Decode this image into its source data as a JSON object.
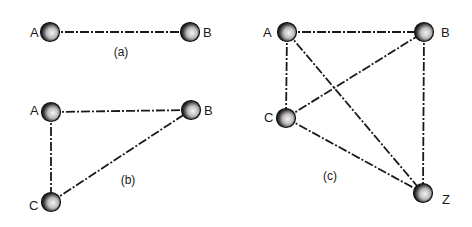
{
  "figures": [
    {
      "caption": "(a)",
      "caption_pos": [
        121,
        56
      ],
      "nodes": [
        {
          "id": "A",
          "label": "A",
          "x": 50,
          "y": 32,
          "lx": 30,
          "ly": 37
        },
        {
          "id": "B",
          "label": "B",
          "x": 190,
          "y": 32,
          "lx": 203,
          "ly": 37
        }
      ],
      "edges": [
        [
          "A",
          "B"
        ]
      ]
    },
    {
      "caption": "(b)",
      "caption_pos": [
        128,
        184
      ],
      "nodes": [
        {
          "id": "A",
          "label": "A",
          "x": 51,
          "y": 112,
          "lx": 30,
          "ly": 115
        },
        {
          "id": "B",
          "label": "B",
          "x": 191,
          "y": 110,
          "lx": 204,
          "ly": 115
        },
        {
          "id": "C",
          "label": "C",
          "x": 51,
          "y": 202,
          "lx": 29,
          "ly": 210
        }
      ],
      "edges": [
        [
          "A",
          "B"
        ],
        [
          "A",
          "C"
        ],
        [
          "C",
          "B"
        ]
      ]
    },
    {
      "caption": "(c)",
      "caption_pos": [
        330,
        180
      ],
      "nodes": [
        {
          "id": "A",
          "label": "A",
          "x": 287,
          "y": 32,
          "lx": 263,
          "ly": 37
        },
        {
          "id": "B",
          "label": "B",
          "x": 424,
          "y": 32,
          "lx": 441,
          "ly": 37
        },
        {
          "id": "C",
          "label": "C",
          "x": 286,
          "y": 118,
          "lx": 264,
          "ly": 122
        },
        {
          "id": "Z",
          "label": "Z",
          "x": 423,
          "y": 193,
          "lx": 442,
          "ly": 204
        }
      ],
      "edges": [
        [
          "A",
          "B"
        ],
        [
          "A",
          "C"
        ],
        [
          "A",
          "Z"
        ],
        [
          "C",
          "B"
        ],
        [
          "C",
          "Z"
        ],
        [
          "B",
          "Z"
        ]
      ]
    }
  ],
  "colors": {
    "ink": "#1a1a1a",
    "background": "#ffffff"
  }
}
